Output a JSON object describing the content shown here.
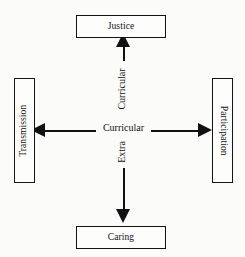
{
  "diagram": {
    "type": "cross-axis-diagram",
    "background_color": "#fbfbfa",
    "line_color": "#111111",
    "text_color": "#121212",
    "nodes": {
      "top": {
        "label": "Justice",
        "orientation": "horizontal"
      },
      "bottom": {
        "label": "Caring",
        "orientation": "horizontal"
      },
      "left": {
        "label": "Transmission",
        "orientation": "vertical-up"
      },
      "right": {
        "label": "Participation",
        "orientation": "vertical-down"
      }
    },
    "axes": {
      "horizontal": {
        "label": "Curricular",
        "arrowheads": "both",
        "from": "Transmission",
        "to": "Participation"
      },
      "vertical": {
        "label": "Extra Curricular",
        "label_part_top": "Curricular",
        "label_part_bottom": "Extra",
        "arrowheads": "both",
        "from": "Caring",
        "to": "Justice"
      }
    }
  }
}
